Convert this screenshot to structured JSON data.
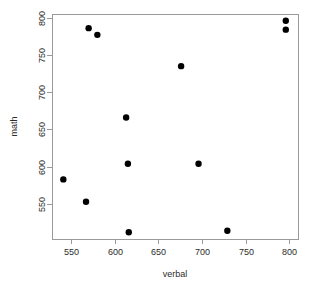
{
  "chart_data": {
    "type": "scatter",
    "title": "",
    "subtitle": "",
    "xlabel": "verbal",
    "ylabel": "math",
    "xlim": [
      528,
      810
    ],
    "ylim": [
      503,
      805
    ],
    "xticks": [
      550,
      600,
      650,
      700,
      750,
      800
    ],
    "yticks": [
      550,
      600,
      650,
      700,
      750,
      800
    ],
    "xtick_labels": [
      "550",
      "600",
      "650",
      "700",
      "750",
      "800"
    ],
    "ytick_labels": [
      "550",
      "600",
      "650",
      "700",
      "750",
      "800"
    ],
    "grid": false,
    "legend": null,
    "legend_position": "none",
    "point_color": "#000000",
    "point_shape": "filled-circle",
    "point_size": 3.2,
    "axis_color": "#9a9a9a",
    "background_color": "#ffffff",
    "annotations": [],
    "series": [
      {
        "name": "students",
        "x": [
          570,
          580,
          796,
          796,
          676,
          613,
          615,
          696,
          541,
          567,
          616,
          729
        ],
        "y": [
          786,
          777,
          796,
          784,
          735,
          666,
          604,
          604,
          583,
          553,
          512,
          514
        ]
      }
    ],
    "points": [
      {
        "verbal": 570,
        "math": 786
      },
      {
        "verbal": 580,
        "math": 777
      },
      {
        "verbal": 796,
        "math": 796
      },
      {
        "verbal": 796,
        "math": 784
      },
      {
        "verbal": 676,
        "math": 735
      },
      {
        "verbal": 613,
        "math": 666
      },
      {
        "verbal": 615,
        "math": 604
      },
      {
        "verbal": 696,
        "math": 604
      },
      {
        "verbal": 541,
        "math": 583
      },
      {
        "verbal": 567,
        "math": 553
      },
      {
        "verbal": 616,
        "math": 512
      },
      {
        "verbal": 729,
        "math": 514
      }
    ]
  }
}
